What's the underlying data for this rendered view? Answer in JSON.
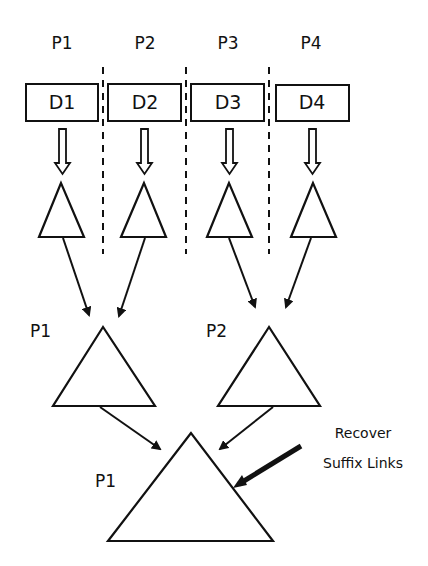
{
  "diagram": {
    "processor_labels": [
      "P1",
      "P2",
      "P3",
      "P4"
    ],
    "data_blocks": [
      "D1",
      "D2",
      "D3",
      "D4"
    ],
    "merge_level_1": {
      "left_label": "P1",
      "right_label": "P2"
    },
    "merge_level_2": {
      "label": "P1"
    },
    "annotation": {
      "line1": "Recover",
      "line2": "Suffix Links"
    },
    "colors": {
      "stroke": "#111111",
      "background": "#ffffff"
    }
  }
}
